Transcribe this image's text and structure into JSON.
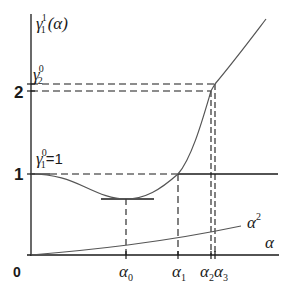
{
  "diagram": {
    "y_axis_label": {
      "base": "γ",
      "sub": "1",
      "sup": "1",
      "arg": "(α)"
    },
    "x_axis_label": "α",
    "origin_label": "0",
    "y_ticks": [
      {
        "label": "1",
        "value": 1
      },
      {
        "label": "2",
        "value": 2
      }
    ],
    "level_labels": [
      {
        "base": "γ",
        "sub": "2",
        "sup": "0",
        "eq": ""
      },
      {
        "base": "γ",
        "sub": "1",
        "sup": "0",
        "eq": "=1"
      }
    ],
    "x_ticks": [
      {
        "base": "α",
        "sub": "0"
      },
      {
        "base": "α",
        "sub": "1"
      },
      {
        "base": "α",
        "sub": "2"
      },
      {
        "base": "α",
        "sub": "3"
      }
    ],
    "curve_labels": {
      "alpha_squared": {
        "base": "α",
        "sup": "2"
      }
    },
    "colors": {
      "line": "#1a1a1a",
      "curve": "#555555",
      "background": "#ffffff"
    }
  }
}
